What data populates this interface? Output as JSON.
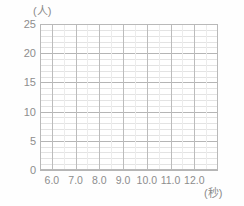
{
  "chart_data": {
    "type": "bar",
    "title": "",
    "subtitle": "",
    "xlabel": "(秒)",
    "ylabel": "(人)",
    "xlim": [
      5.5,
      13.0
    ],
    "ylim": [
      0,
      25
    ],
    "x_tick_labels": [
      "6.0",
      "7.0",
      "8.0",
      "9.0",
      "10.0",
      "11.0",
      "12.0"
    ],
    "x_tick_values": [
      6.0,
      7.0,
      8.0,
      9.0,
      10.0,
      11.0,
      12.0
    ],
    "y_tick_labels": [
      "25",
      "20",
      "15",
      "10",
      "5",
      "0"
    ],
    "y_tick_values": [
      25,
      20,
      15,
      10,
      5,
      0
    ],
    "y_minor_step": 1,
    "x_minor_step": 0.5,
    "grid": true,
    "legend": false,
    "categories": [],
    "values": [],
    "series": [],
    "note": "Empty plotting grid; no data plotted."
  },
  "axes": {
    "y_unit_caption": "(人)",
    "x_unit_caption": "(秒)",
    "y_ticks": [
      {
        "label": "25",
        "value": 25
      },
      {
        "label": "20",
        "value": 20
      },
      {
        "label": "15",
        "value": 15
      },
      {
        "label": "10",
        "value": 10
      },
      {
        "label": "5",
        "value": 5
      },
      {
        "label": "0",
        "value": 0
      }
    ],
    "x_ticks": [
      {
        "label": "6.0",
        "value": 6.0
      },
      {
        "label": "7.0",
        "value": 7.0
      },
      {
        "label": "8.0",
        "value": 8.0
      },
      {
        "label": "9.0",
        "value": 9.0
      },
      {
        "label": "10.0",
        "value": 10.0
      },
      {
        "label": "11.0",
        "value": 11.0
      },
      {
        "label": "12.0",
        "value": 12.0
      }
    ]
  },
  "colors": {
    "background": "#fefefe",
    "plot_background": "#ffffff",
    "grid_major": "#b5b5b5",
    "grid_minor": "#e3e3e3",
    "frame": "#b9b9b9",
    "text": "#8d8d8d"
  }
}
